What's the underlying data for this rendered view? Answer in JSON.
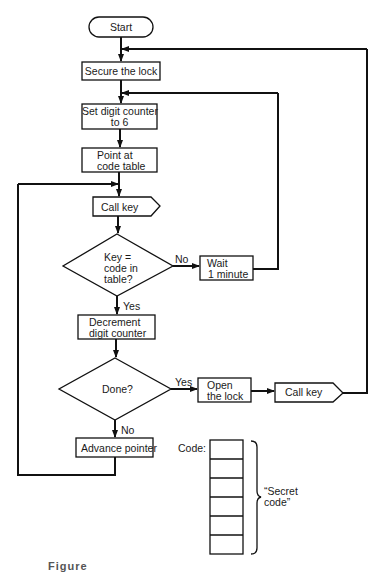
{
  "flowchart": {
    "start": "Start",
    "secure": "Secure the lock",
    "set_counter_l1": "Set digit counter",
    "set_counter_l2": "to 6",
    "point_l1": "Point at",
    "point_l2": "code table",
    "call_key_1": "Call key",
    "decision_1_l1": "Key =",
    "decision_1_l2": "code in",
    "decision_1_l3": "table?",
    "decision_1_no": "No",
    "decision_1_yes": "Yes",
    "wait_l1": "Wait",
    "wait_l2": "1 minute",
    "decrement_l1": "Decrement",
    "decrement_l2": "digit counter",
    "decision_2": "Done?",
    "decision_2_yes": "Yes",
    "decision_2_no": "No",
    "open_l1": "Open",
    "open_l2": "the lock",
    "call_key_2": "Call key",
    "advance": "Advance pointer"
  },
  "code_table": {
    "label": "Code:",
    "cells": 6,
    "brace_label_l1": "“Secret",
    "brace_label_l2": "code”"
  },
  "caption": "Figure"
}
